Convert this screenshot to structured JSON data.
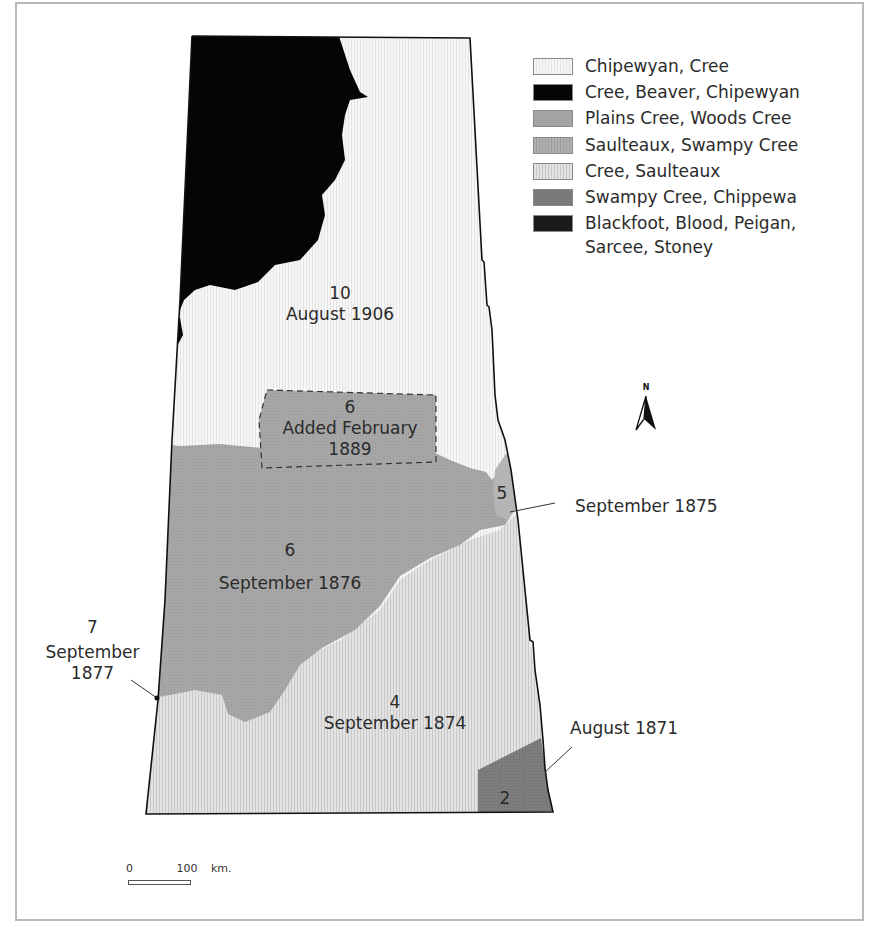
{
  "legend": {
    "items": [
      {
        "label": "Chipewyan, Cree",
        "color": "#f4f4f4"
      },
      {
        "label": "Cree, Beaver, Chipewyan",
        "color": "#050505"
      },
      {
        "label": "Plains Cree, Woods Cree",
        "color": "#a3a3a3"
      },
      {
        "label": "Saulteaux, Swampy Cree",
        "color": "#a8a8a8"
      },
      {
        "label": "Cree, Saulteaux",
        "color": "#dcdcdc"
      },
      {
        "label": "Swampy Cree, Chippewa",
        "color": "#7a7a7a"
      },
      {
        "label": "Blackfoot, Blood, Peigan,",
        "label_line2": "Sarcee, Stoney",
        "color": "#1a1a1a"
      }
    ]
  },
  "north_arrow": {
    "label": "N"
  },
  "regions": {
    "treaty10": {
      "number": "10",
      "date": "August 1906"
    },
    "treaty6_added": {
      "number": "6",
      "line1": "Added February",
      "line2": "1889"
    },
    "treaty6": {
      "number": "6",
      "date": "September 1876"
    },
    "treaty5": {
      "number": "5",
      "callout": "September 1875"
    },
    "treaty7": {
      "number": "7",
      "line1": "September",
      "line2": "1877"
    },
    "treaty4": {
      "number": "4",
      "date": "September 1874"
    },
    "treaty2": {
      "number": "2",
      "callout": "August 1871"
    }
  },
  "scale": {
    "start": "0",
    "end": "100",
    "unit": "km."
  }
}
